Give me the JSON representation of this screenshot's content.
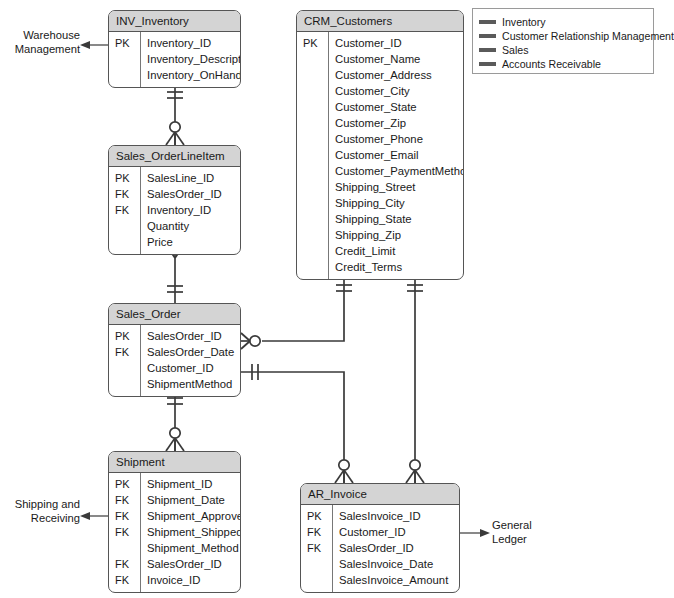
{
  "diagram": {
    "line_color": "#3a3a3a",
    "header_fill": "#d4d4d4",
    "border_color": "#555555"
  },
  "entities": [
    {
      "id": "inv_inventory",
      "name": "INV_Inventory",
      "x": 108,
      "y": 10,
      "width": 133,
      "attributes": [
        {
          "key": "PK",
          "name": "Inventory_ID"
        },
        {
          "key": "",
          "name": "Inventory_Description"
        },
        {
          "key": "",
          "name": "Inventory_OnHand"
        }
      ]
    },
    {
      "id": "crm_customers",
      "name": "CRM_Customers",
      "x": 296,
      "y": 10,
      "width": 168,
      "attributes": [
        {
          "key": "PK",
          "name": "Customer_ID"
        },
        {
          "key": "",
          "name": "Customer_Name"
        },
        {
          "key": "",
          "name": "Customer_Address"
        },
        {
          "key": "",
          "name": "Customer_City"
        },
        {
          "key": "",
          "name": "Customer_State"
        },
        {
          "key": "",
          "name": "Customer_Zip"
        },
        {
          "key": "",
          "name": "Customer_Phone"
        },
        {
          "key": "",
          "name": "Customer_Email"
        },
        {
          "key": "",
          "name": "Customer_PaymentMethod"
        },
        {
          "key": "",
          "name": "Shipping_Street"
        },
        {
          "key": "",
          "name": "Shipping_City"
        },
        {
          "key": "",
          "name": "Shipping_State"
        },
        {
          "key": "",
          "name": "Shipping_Zip"
        },
        {
          "key": "",
          "name": "Credit_Limit"
        },
        {
          "key": "",
          "name": "Credit_Terms"
        }
      ]
    },
    {
      "id": "sales_orderlineitem",
      "name": "Sales_OrderLineItem",
      "x": 108,
      "y": 145,
      "width": 133,
      "attributes": [
        {
          "key": "PK",
          "name": "SalesLine_ID"
        },
        {
          "key": "FK",
          "name": "SalesOrder_ID"
        },
        {
          "key": "FK",
          "name": "Inventory_ID"
        },
        {
          "key": "",
          "name": "Quantity"
        },
        {
          "key": "",
          "name": "Price"
        }
      ]
    },
    {
      "id": "sales_order",
      "name": "Sales_Order",
      "x": 108,
      "y": 303,
      "width": 133,
      "attributes": [
        {
          "key": "PK",
          "name": "SalesOrder_ID"
        },
        {
          "key": "FK",
          "name": "SalesOrder_Date"
        },
        {
          "key": "",
          "name": "Customer_ID"
        },
        {
          "key": "",
          "name": "ShipmentMethod"
        }
      ]
    },
    {
      "id": "shipment",
      "name": "Shipment",
      "x": 108,
      "y": 451,
      "width": 133,
      "attributes": [
        {
          "key": "PK",
          "name": "Shipment_ID"
        },
        {
          "key": "FK",
          "name": "Shipment_Date"
        },
        {
          "key": "FK",
          "name": "Shipment_Approver"
        },
        {
          "key": "FK",
          "name": "Shipment_ShippedBy"
        },
        {
          "key": "",
          "name": "Shipment_Method"
        },
        {
          "key": "FK",
          "name": "SalesOrder_ID"
        },
        {
          "key": "FK",
          "name": "Invoice_ID"
        }
      ]
    },
    {
      "id": "ar_invoice",
      "name": "AR_Invoice",
      "x": 300,
      "y": 483,
      "width": 160,
      "attributes": [
        {
          "key": "PK",
          "name": "SalesInvoice_ID"
        },
        {
          "key": "FK",
          "name": "Customer_ID"
        },
        {
          "key": "FK",
          "name": "SalesOrder_ID"
        },
        {
          "key": "",
          "name": "SalesInvoice_Date"
        },
        {
          "key": "",
          "name": "SalesInvoice_Amount"
        }
      ]
    }
  ],
  "legend": {
    "x": 472,
    "y": 8,
    "width": 182,
    "height": 66,
    "items": [
      {
        "label": "Inventory",
        "color": "#5a5a5a"
      },
      {
        "label": "Customer Relationship Management",
        "color": "#5a5a5a"
      },
      {
        "label": "Sales",
        "color": "#5a5a5a"
      },
      {
        "label": "Accounts Receivable",
        "color": "#5a5a5a"
      }
    ]
  },
  "annotations": [
    {
      "id": "warehouse-management",
      "lines": [
        "Warehouse",
        "Management"
      ],
      "x": 8,
      "y": 28,
      "width": 72,
      "align": "right"
    },
    {
      "id": "shipping-and-receiving",
      "lines": [
        "Shipping and",
        "Receiving"
      ],
      "x": 8,
      "y": 497,
      "width": 72,
      "align": "right"
    },
    {
      "id": "general-ledger",
      "lines": [
        "General",
        "Ledger"
      ],
      "x": 492,
      "y": 518,
      "width": 72,
      "align": "left"
    }
  ],
  "relationships": [
    {
      "id": "inventory-to-lineitem",
      "from": "INV_Inventory",
      "to": "Sales_OrderLineItem",
      "from_cardinality": "one-and-only-one",
      "to_cardinality": "zero-or-many"
    },
    {
      "id": "lineitem-to-order",
      "from": "Sales_OrderLineItem",
      "to": "Sales_Order",
      "from_cardinality": "many",
      "to_cardinality": "one-and-only-one"
    },
    {
      "id": "order-to-shipment",
      "from": "Sales_Order",
      "to": "Shipment",
      "from_cardinality": "one-and-only-one",
      "to_cardinality": "zero-or-many"
    },
    {
      "id": "customers-to-order",
      "from": "CRM_Customers",
      "to": "Sales_Order",
      "from_cardinality": "one-and-only-one",
      "to_cardinality": "zero-or-many"
    },
    {
      "id": "customers-to-invoice",
      "from": "CRM_Customers",
      "to": "AR_Invoice",
      "from_cardinality": "one-and-only-one",
      "to_cardinality": "zero-or-many"
    },
    {
      "id": "order-to-invoice",
      "from": "Sales_Order",
      "to": "AR_Invoice",
      "from_cardinality": "one-and-only-one",
      "to_cardinality": "zero-or-many"
    }
  ]
}
